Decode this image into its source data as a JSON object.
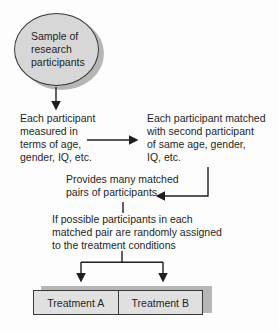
{
  "diagram": {
    "name": "matched-pairs-design-flowchart",
    "sample_ellipse": {
      "lines": [
        "Sample of",
        "research",
        "participants"
      ]
    },
    "measured_block": {
      "lines": [
        "Each participant",
        "measured in",
        "terms of age,",
        "gender, IQ, etc."
      ]
    },
    "matched_block": {
      "lines": [
        "Each participant matched",
        "with second participant",
        "of same age, gender,",
        "IQ, etc."
      ]
    },
    "provides_block": {
      "lines": [
        "Provides many matched",
        "pairs of participants"
      ]
    },
    "condition_block": {
      "lines": [
        "If possible participants in each",
        "matched pair are randomly assigned",
        "to the treatment conditions"
      ]
    },
    "treatment_a": {
      "label": "Treatment A"
    },
    "treatment_b": {
      "label": "Treatment B"
    },
    "connectors": [
      "sample-to-measured-arrow-down",
      "measured-to-matched-arrow-right",
      "matched-to-provides-elbow-arrow-left",
      "provides-to-condition-line",
      "condition-branch-lines",
      "branch-to-treatment-a-arrow-down",
      "branch-to-treatment-b-arrow-down"
    ],
    "colors": {
      "background": "#fdfdfd",
      "shape_fill": "#d7d7d7",
      "box_fill": "#e0e0e0",
      "shape_border": "#383838",
      "shadow": "#b6b6b6",
      "line": "#1f1f1f",
      "text": "#1f1f1f"
    }
  }
}
